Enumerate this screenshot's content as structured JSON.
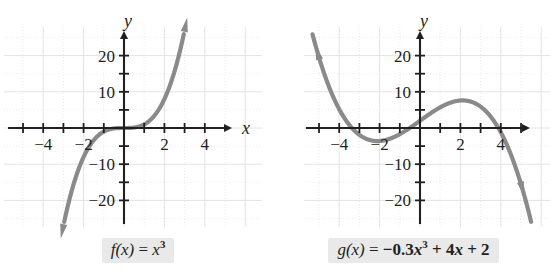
{
  "figure": {
    "title": "",
    "background_color": "#ffffff",
    "curve_color": "#8a8a8a",
    "axis_color": "#231f20",
    "grid_color": "#e4e4e8",
    "caption_background": "#e9e9e9"
  },
  "panels": [
    {
      "id": "left",
      "axis_label_x": "x",
      "axis_label_y": "y",
      "x_tick_labels": [
        "-4",
        "-2",
        "2",
        "4"
      ],
      "y_tick_labels": [
        "20",
        "10",
        "-10",
        "-20"
      ],
      "caption": {
        "fn": "f",
        "arg": "(x)",
        "equals": "=",
        "expr_plain": "f(x) = x³",
        "terms": [
          {
            "base": "x",
            "sup": "3",
            "italic": true,
            "bold": false
          }
        ]
      }
    },
    {
      "id": "right",
      "axis_label_x": "",
      "axis_label_y": "y",
      "x_tick_labels": [
        "-4",
        "-2",
        "2",
        "4"
      ],
      "y_tick_labels": [
        "20",
        "10",
        "-10",
        "-20"
      ],
      "caption": {
        "fn": "g",
        "arg": "(x)",
        "equals": "=",
        "expr_plain": "g(x) = -0.3x³ + 4x + 2",
        "terms": [
          {
            "text": "−0.3",
            "bold": true
          },
          {
            "base": "x",
            "sup": "3",
            "italic": true,
            "bold": true
          },
          {
            "text": "+ 4",
            "bold": true
          },
          {
            "base": "x",
            "sup": "",
            "italic": true,
            "bold": true
          },
          {
            "text": "+ 2",
            "bold": true
          }
        ]
      }
    }
  ],
  "chart_data": [
    {
      "type": "line",
      "panel": "left",
      "title": "f(x) = x^3",
      "function": "f(x) = x^3",
      "coefficients": {
        "a3": 1,
        "a2": 0,
        "a1": 0,
        "a0": 0
      },
      "xlabel": "x",
      "ylabel": "y",
      "xlim": [
        -5.6,
        5.6
      ],
      "ylim": [
        -26,
        26
      ],
      "xticks": [
        -5,
        -4,
        -3,
        -2,
        -1,
        1,
        2,
        3,
        4,
        5
      ],
      "xtick_labels": {
        "-4": "-4",
        "-2": "-2",
        "2": "2",
        "4": "4"
      },
      "yticks": [
        -20,
        -15,
        -10,
        -5,
        5,
        10,
        15,
        20
      ],
      "ytick_labels": {
        "20": "20",
        "10": "10",
        "-10": "-10",
        "-20": "-20"
      },
      "grid": true,
      "grid_style": "dotted-light",
      "legend": false,
      "curve_arrows": [
        "start",
        "end"
      ],
      "x": [
        -3.0,
        -2.8,
        -2.6,
        -2.4,
        -2.2,
        -2.0,
        -1.8,
        -1.6,
        -1.4,
        -1.2,
        -1.0,
        -0.8,
        -0.6,
        -0.4,
        -0.2,
        0.0,
        0.2,
        0.4,
        0.6,
        0.8,
        1.0,
        1.2,
        1.4,
        1.6,
        1.8,
        2.0,
        2.2,
        2.4,
        2.6,
        2.8,
        3.0
      ],
      "y": [
        -27.0,
        -21.95,
        -17.58,
        -13.82,
        -10.65,
        -8.0,
        -5.83,
        -4.1,
        -2.74,
        -1.73,
        -1.0,
        -0.51,
        -0.22,
        -0.06,
        -0.01,
        0.0,
        0.01,
        0.06,
        0.22,
        0.51,
        1.0,
        1.73,
        2.74,
        4.1,
        5.83,
        8.0,
        10.65,
        13.82,
        17.58,
        21.95,
        27.0
      ]
    },
    {
      "type": "line",
      "panel": "right",
      "title": "g(x) = -0.3x^3 + 4x + 2",
      "function": "g(x) = -0.3x^3 + 4x + 2",
      "coefficients": {
        "a3": -0.3,
        "a2": 0,
        "a1": 4,
        "a0": 2
      },
      "xlabel": "",
      "ylabel": "y",
      "xlim": [
        -5.6,
        5.6
      ],
      "ylim": [
        -26,
        26
      ],
      "xticks": [
        -5,
        -4,
        -3,
        -2,
        -1,
        1,
        2,
        3,
        4,
        5
      ],
      "xtick_labels": {
        "-4": "-4",
        "-2": "-2",
        "2": "2",
        "4": "4"
      },
      "yticks": [
        -20,
        -15,
        -10,
        -5,
        5,
        10,
        15,
        20
      ],
      "ytick_labels": {
        "20": "20",
        "10": "10",
        "-10": "-10",
        "-20": "-20"
      },
      "grid": true,
      "grid_style": "dotted-light",
      "legend": false,
      "curve_arrows": [
        "start",
        "end"
      ],
      "x": [
        -5.0,
        -4.75,
        -4.5,
        -4.25,
        -4.0,
        -3.75,
        -3.5,
        -3.25,
        -3.0,
        -2.75,
        -2.5,
        -2.25,
        -2.0,
        -1.75,
        -1.5,
        -1.25,
        -1.0,
        -0.75,
        -0.5,
        -0.25,
        0.0,
        0.25,
        0.5,
        0.75,
        1.0,
        1.25,
        1.5,
        1.75,
        2.0,
        2.25,
        2.5,
        2.75,
        3.0,
        3.25,
        3.5,
        3.75,
        4.0,
        4.25,
        4.5,
        4.75,
        5.0
      ],
      "y": [
        19.5,
        15.16,
        11.34,
        8.03,
        5.2,
        2.83,
        0.89,
        -0.69,
        -1.9,
        -2.79,
        -3.31,
        -3.58,
        -3.6,
        -3.39,
        -2.99,
        -1.41,
        -1.7,
        -0.87,
        0.04,
        1.0,
        2.0,
        3.0,
        3.96,
        4.87,
        5.7,
        6.41,
        6.99,
        5.39,
        7.6,
        7.58,
        7.31,
        6.76,
        5.9,
        4.7,
        3.14,
        1.17,
        -1.2,
        -4.02,
        -7.34,
        -11.17,
        -15.5
      ]
    }
  ]
}
